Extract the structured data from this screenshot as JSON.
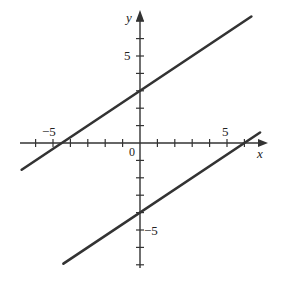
{
  "chart_data": {
    "type": "line",
    "title": "",
    "xlabel": "x",
    "ylabel": "y",
    "xlim": [
      -6.8,
      7.0
    ],
    "ylim": [
      -7.0,
      7.2
    ],
    "grid": false,
    "x_tick_labels": [
      "-5",
      "5"
    ],
    "y_tick_labels": [
      "5",
      "-5"
    ],
    "origin_label": "0",
    "series": [
      {
        "name": "line-upper",
        "equation": "y = (2/3)x + 3",
        "slope": 0.667,
        "intercept": 3,
        "x": [
          -6.8,
          6.4
        ],
        "y": [
          -1.9,
          7.3
        ]
      },
      {
        "name": "line-lower",
        "equation": "y = (2/3)x - 4",
        "slope": 0.667,
        "intercept": -4,
        "x": [
          -4.4,
          6.9
        ],
        "y": [
          -7.0,
          0.7
        ]
      }
    ]
  },
  "colors": {
    "line": "#333333",
    "axis": "#333333"
  }
}
